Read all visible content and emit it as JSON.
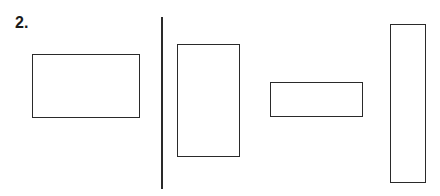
{
  "figure": {
    "label": "2.",
    "divider": {
      "orientation": "vertical"
    },
    "shapes": [
      {
        "id": "rect-1",
        "type": "rectangle",
        "orientation": "horizontal",
        "side": "left"
      },
      {
        "id": "rect-2",
        "type": "rectangle",
        "orientation": "vertical",
        "side": "right"
      },
      {
        "id": "rect-3",
        "type": "rectangle",
        "orientation": "horizontal",
        "side": "right"
      },
      {
        "id": "rect-4",
        "type": "rectangle",
        "orientation": "vertical",
        "side": "right"
      }
    ]
  }
}
